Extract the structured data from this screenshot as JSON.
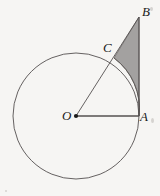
{
  "figure": {
    "background_color": "#f6f5f3",
    "stroke_color": "#555050",
    "shade_color": "#a3a1a0",
    "shade_stroke_color": "#6e6b69",
    "label_color": "#1a1a1a",
    "width": 160,
    "height": 196
  },
  "circle": {
    "center_label": "O",
    "center_x": 76,
    "center_y": 116,
    "radius": 63,
    "stroke_width": 0.9
  },
  "points": [
    {
      "id": "O",
      "label": "O",
      "x": 76,
      "y": 116,
      "label_x": 62,
      "label_y": 109,
      "dot": true
    },
    {
      "id": "A",
      "label": "A",
      "x": 139,
      "y": 116,
      "label_x": 140,
      "label_y": 110,
      "dot": false
    },
    {
      "id": "B",
      "label": "B",
      "x": 139,
      "y": 17,
      "label_x": 142,
      "label_y": 5,
      "dot": false
    },
    {
      "id": "C",
      "label": "C",
      "x": 114,
      "y": 58,
      "label_x": 103,
      "label_y": 41,
      "dot": false
    }
  ],
  "segments": [
    {
      "id": "OA",
      "from": "O",
      "to": "A",
      "label": "radius O to A",
      "x1": 76,
      "y1": 116,
      "x2": 139,
      "y2": 116
    },
    {
      "id": "OB",
      "from": "O",
      "to": "B",
      "label": "line O through C to B",
      "x1": 76,
      "y1": 116,
      "x2": 139,
      "y2": 17
    },
    {
      "id": "AB",
      "from": "A",
      "to": "B",
      "label": "tangent A to B",
      "x1": 139,
      "y1": 116,
      "x2": 139,
      "y2": 17
    }
  ],
  "shaded_region": {
    "name": "region bounded by arc AC, segment CB and segment BA",
    "path": "M 114 58 L 139 17 L 139 116 A 63 63 0 0 0 114 58 Z",
    "fill": "#a3a1a0"
  },
  "arc_highlight": {
    "name": "arc from A to C",
    "path": "M 139 116 A 63 63 0 0 0 114 58"
  },
  "specks": [
    {
      "x": 150,
      "y": 7,
      "w": 3,
      "h": 4
    },
    {
      "x": 151,
      "y": 118,
      "w": 3,
      "h": 5
    },
    {
      "x": 5,
      "y": 190,
      "w": 2,
      "h": 2
    }
  ]
}
